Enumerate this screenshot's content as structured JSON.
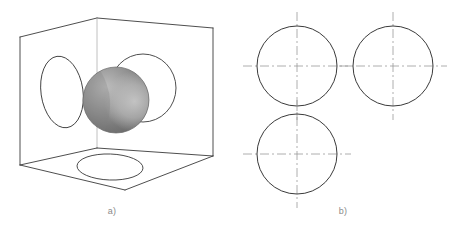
{
  "figure": {
    "background_color": "#ffffff",
    "line_color": "#3a3a3a",
    "centerline_color": "#9a9a9a",
    "caption_color": "#8a8a8a"
  },
  "panels": [
    {
      "id": "panel-a",
      "caption": "a)",
      "caption_x": 112,
      "caption_y": 214,
      "description": "Pictorial isometric open cube containing a shaded sphere, with circular projections on the three interior faces"
    },
    {
      "id": "panel-b",
      "caption": "b)",
      "caption_x": 343,
      "caption_y": 214,
      "description": "Three orthographic views of the sphere, each a circle with dash-dot centerlines"
    }
  ],
  "cube": {
    "stroke": "#3a3a3a",
    "stroke_width": 0.9,
    "fill": "#ffffff",
    "vertices": {
      "front_top_left": [
        20,
        37
      ],
      "back_top_mid": [
        97,
        18
      ],
      "right_top_right": [
        213,
        28
      ],
      "front_bottom_left": [
        20,
        165
      ],
      "back_bottom_mid": [
        97,
        148
      ],
      "right_bottom_right": [
        213,
        156
      ],
      "floor_front": [
        125,
        190
      ]
    },
    "faces": [
      {
        "name": "left-interior-face",
        "points": "20,37 97,18 97,148 20,165"
      },
      {
        "name": "right-interior-face",
        "points": "97,18 213,28 213,156 97,148"
      },
      {
        "name": "bottom-interior-face",
        "points": "20,165 97,148 213,156 125,190"
      }
    ],
    "edges": [
      {
        "name": "vertical-back-corner-edge",
        "x1": 97,
        "y1": 18,
        "x2": 97,
        "y2": 148
      },
      {
        "name": "left-vertical-front-edge",
        "x1": 20,
        "y1": 37,
        "x2": 20,
        "y2": 165
      },
      {
        "name": "right-vertical-front-edge",
        "x1": 213,
        "y1": 28,
        "x2": 213,
        "y2": 156
      },
      {
        "name": "top-left-edge",
        "x1": 20,
        "y1": 37,
        "x2": 97,
        "y2": 18
      },
      {
        "name": "top-right-edge",
        "x1": 97,
        "y1": 18,
        "x2": 213,
        "y2": 28
      },
      {
        "name": "floor-back-left-edge",
        "x1": 20,
        "y1": 165,
        "x2": 97,
        "y2": 148
      },
      {
        "name": "floor-back-right-edge",
        "x1": 97,
        "y1": 148,
        "x2": 213,
        "y2": 156
      },
      {
        "name": "floor-front-left-edge",
        "x1": 20,
        "y1": 165,
        "x2": 125,
        "y2": 190
      },
      {
        "name": "floor-front-right-edge",
        "x1": 125,
        "y1": 190,
        "x2": 213,
        "y2": 156
      }
    ]
  },
  "projections_on_cube": [
    {
      "name": "left-face-ellipse",
      "cx": 62,
      "cy": 92,
      "rx": 21,
      "ry": 36,
      "rotation": -8,
      "stroke": "#3a3a3a"
    },
    {
      "name": "right-face-ellipse",
      "cx": 143,
      "cy": 88,
      "rx": 33,
      "ry": 34,
      "rotation": 0,
      "stroke": "#3a3a3a"
    },
    {
      "name": "bottom-face-ellipse",
      "cx": 110,
      "cy": 167,
      "rx": 33,
      "ry": 13,
      "rotation": 2,
      "stroke": "#3a3a3a"
    }
  ],
  "sphere": {
    "name": "shaded-sphere",
    "cx": 116,
    "cy": 100,
    "r": 33,
    "base_color": "#8c8c8c",
    "highlight_color": "#b4b4b4",
    "shadow_color": "#6e6e6e",
    "crescent_color": "#bcbcbc",
    "outline_color": "#6a6a6a",
    "highlight_offset": {
      "cx": "35%",
      "cy": "30%"
    }
  },
  "orthographic_views": {
    "circle_stroke": "#3a3a3a",
    "circle_stroke_width": 1.0,
    "centerline_color": "#9a9a9a",
    "centerline_width": 0.8,
    "centerline_dasharray": "9,3,2,3",
    "centerline_overhang": 14,
    "circles": [
      {
        "name": "top-left-view-circle",
        "label": "front-view",
        "cx": 297,
        "cy": 66,
        "r": 40
      },
      {
        "name": "top-right-view-circle",
        "label": "side-view",
        "cx": 393,
        "cy": 66,
        "r": 40
      },
      {
        "name": "bottom-left-view-circle",
        "label": "top-view",
        "cx": 297,
        "cy": 154,
        "r": 40
      }
    ]
  }
}
